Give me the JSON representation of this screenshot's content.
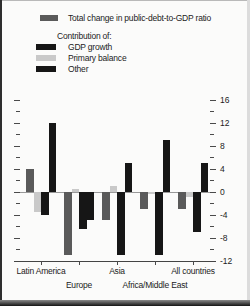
{
  "legend": {
    "total": {
      "label": "Total change in public-debt-to-GDP ratio",
      "color": "#5a5a5a"
    },
    "contribution_heading": "Contribution of:",
    "items": [
      {
        "label": "GDP growth",
        "color": "#161616"
      },
      {
        "label": "Primary balance",
        "color": "#c9c9c9"
      },
      {
        "label": "Other",
        "color": "#161616"
      }
    ]
  },
  "chart_data": {
    "type": "bar",
    "title": "",
    "xlabel": "",
    "ylabel": "",
    "categories": [
      "Latin America",
      "Europe",
      "Asia",
      "Africa/Middle East",
      "All countries"
    ],
    "series": [
      {
        "name": "Total change in public-debt-to-GDP ratio",
        "color": "#5a5a5a",
        "values": [
          4,
          -11,
          -5,
          -3,
          -3
        ]
      },
      {
        "name": "Primary balance",
        "color": "#c9c9c9",
        "values": [
          -3.5,
          0.5,
          1,
          -0.5,
          -1
        ]
      },
      {
        "name": "GDP growth",
        "color": "#161616",
        "values": [
          -4,
          -6.5,
          -11,
          -11,
          -7
        ]
      },
      {
        "name": "Other",
        "color": "#161616",
        "values": [
          12,
          -5,
          5,
          9,
          5
        ]
      }
    ],
    "ylim": [
      -12,
      16
    ],
    "yticks_labeled": [
      16,
      12,
      8,
      4,
      0,
      -4,
      -8,
      -12
    ],
    "ytick_minor_step": 2,
    "grid": false,
    "legend_position": "top-left",
    "value_axis_side": "right"
  }
}
